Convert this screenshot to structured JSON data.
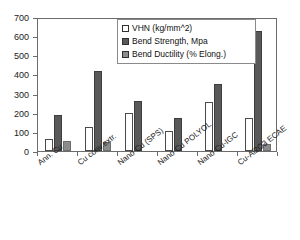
{
  "chart_data": {
    "type": "bar",
    "title": "",
    "xlabel": "",
    "ylabel": "",
    "ylim": [
      0,
      700
    ],
    "yticks": [
      0,
      100,
      200,
      300,
      400,
      500,
      600,
      700
    ],
    "grid": false,
    "legend_position": "top-center-inside",
    "categories": [
      "Ann. Cu",
      "Cu conv.extr.",
      "Nano Cu (SPS)",
      "Nano Cu POLYOL",
      "Nano Cu-IGC",
      "Cu-Al2O3 ECAE"
    ],
    "series": [
      {
        "name": "VHN (kg/mm^2)",
        "color": "#ffffff",
        "values": [
          65,
          125,
          200,
          105,
          258,
          175
        ]
      },
      {
        "name": "Bend Strength, Mpa",
        "color": "#595959",
        "values": [
          190,
          420,
          260,
          175,
          348,
          628
        ]
      },
      {
        "name": "Bend Ductility (% Elong.)",
        "color": "#8c8c8c",
        "values": [
          50,
          45,
          0,
          0,
          0,
          38
        ]
      }
    ]
  },
  "axis": {
    "y_tick_labels": [
      "700",
      "600",
      "500",
      "400",
      "300",
      "200",
      "100",
      "0"
    ]
  },
  "legend": {
    "entries": [
      {
        "label": "VHN (kg/mm^2)",
        "swatch": "vhn"
      },
      {
        "label": "Bend Strength, Mpa",
        "swatch": "strength"
      },
      {
        "label": "Bend Ductility (% Elong.)",
        "swatch": "ductility"
      }
    ]
  },
  "colors": {
    "vhn": "#ffffff",
    "strength": "#595959",
    "ductility": "#8c8c8c",
    "axis": "#6b6b6b",
    "text": "#1a1a1a"
  }
}
